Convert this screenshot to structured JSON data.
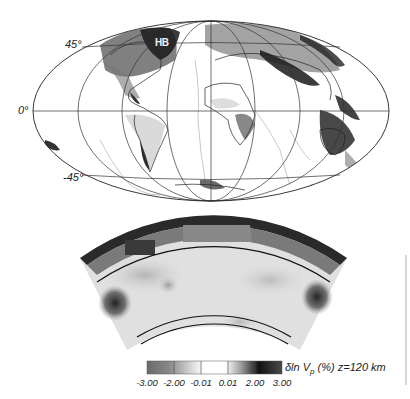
{
  "figure": {
    "map": {
      "projection": "Hammer",
      "latitude_labels": [
        {
          "text": "45°",
          "lat": 45
        },
        {
          "text": "0°",
          "lat": 0
        },
        {
          "text": "-45°",
          "lat": -45
        }
      ],
      "region_label": "HB"
    },
    "cross_section": {
      "description": "Vertical slice through mantle, P-wave velocity anomaly"
    },
    "colorbar": {
      "title_prefix": "δln V",
      "title_sub": "p",
      "title_suffix": " (%) z=120 km",
      "ticks": [
        "-3.00",
        "-2.00",
        "-0.01",
        "0.01",
        "2.00",
        "3.00"
      ],
      "range": [
        -3.0,
        3.0
      ],
      "colors": {
        "low": "#6e6e6e",
        "mid": "#ffffff",
        "high": "#111111"
      }
    }
  }
}
